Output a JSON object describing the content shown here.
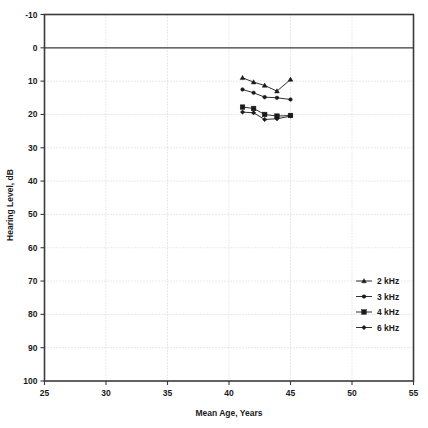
{
  "chart_data": {
    "type": "line",
    "title": "",
    "subtitle": "",
    "xlabel": "Mean Age, Years",
    "ylabel": "Hearing Level, dB",
    "xlim": [
      25,
      55
    ],
    "ylim": [
      -10,
      100
    ],
    "y_inverted": true,
    "xticks": [
      25,
      30,
      35,
      40,
      45,
      50,
      55
    ],
    "xtick_labels": [
      "25",
      "30",
      "35",
      "40",
      "45",
      "50",
      "55"
    ],
    "yticks": [
      -10,
      0,
      10,
      20,
      30,
      40,
      50,
      60,
      70,
      80,
      90,
      100
    ],
    "ytick_labels": [
      "-10",
      "0",
      "10",
      "20",
      "30",
      "40",
      "50",
      "60",
      "70",
      "80",
      "90",
      "100"
    ],
    "grid": true,
    "grid_style": "dotted",
    "legend_position": "right-middle",
    "series": [
      {
        "name": "2 kHz",
        "marker": "triangle",
        "x": [
          41.1,
          42.0,
          42.9,
          43.9,
          45.0
        ],
        "values": [
          9.0,
          10.3,
          11.3,
          13.0,
          9.5
        ]
      },
      {
        "name": "3 kHz",
        "marker": "circle",
        "x": [
          41.1,
          42.0,
          42.9,
          43.9,
          45.0
        ],
        "values": [
          12.5,
          13.5,
          14.8,
          15.0,
          15.5
        ]
      },
      {
        "name": "4 kHz",
        "marker": "square",
        "x": [
          41.1,
          42.0,
          42.9,
          43.9,
          45.0
        ],
        "values": [
          17.8,
          18.2,
          20.0,
          20.5,
          20.3
        ]
      },
      {
        "name": "6 kHz",
        "marker": "diamond",
        "x": [
          41.1,
          42.0,
          42.9,
          43.9,
          45.0
        ],
        "values": [
          19.3,
          19.5,
          21.5,
          21.3,
          20.5
        ]
      }
    ]
  },
  "legend": {
    "entries": [
      {
        "label": "2 kHz"
      },
      {
        "label": "3 kHz"
      },
      {
        "label": "4 kHz"
      },
      {
        "label": "6 kHz"
      }
    ]
  },
  "colors": {
    "data": "#1a1a1a",
    "frame": "#3a3a3a",
    "grid": "#c8c8c8",
    "background": "#ffffff"
  }
}
